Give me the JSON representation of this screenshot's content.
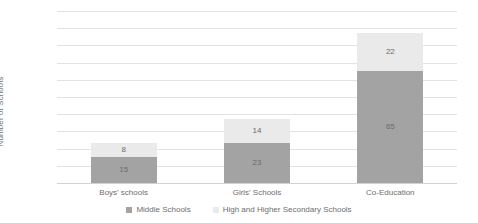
{
  "chart_data": {
    "type": "bar",
    "subtype": "stacked-bar",
    "title": "",
    "subtitle": "",
    "xlabel": "",
    "ylabel": "Number of Schools",
    "categories": [
      "Boys' schools",
      "Girls' Schools",
      "Co-Education"
    ],
    "series": [
      {
        "name": "Middle Schools",
        "color": "#a3a3a3",
        "values": [
          15,
          23,
          65
        ]
      },
      {
        "name": "High and Higher Secondary Schools",
        "color": "#eaeaea",
        "values": [
          8,
          14,
          22
        ]
      }
    ],
    "totals": [
      23,
      37,
      87
    ],
    "ylim": [
      0,
      100
    ],
    "ytick_step": 10,
    "yticks": [
      "100",
      "90",
      "80",
      "70",
      "60",
      "50",
      "40",
      "30",
      "20",
      "10",
      "0"
    ],
    "ytick_values": [
      100,
      90,
      80,
      70,
      60,
      50,
      40,
      30,
      20,
      10,
      0
    ],
    "data_labels": [
      {
        "category": "Boys' schools",
        "middle": "15",
        "high": "8"
      },
      {
        "category": "Girls' Schools",
        "middle": "23",
        "high": "14"
      },
      {
        "category": "Co-Education",
        "middle": "65",
        "high": "22"
      }
    ],
    "grid": {
      "horizontal": true,
      "vertical": false
    },
    "legend": {
      "position": "bottom",
      "entries": [
        {
          "label": "Middle Schools",
          "color": "#a3a3a3"
        },
        {
          "label": "High and Higher Secondary Schools",
          "color": "#eaeaea"
        }
      ]
    },
    "colors": {
      "middle_schools": "#a3a3a3",
      "high_and_higher_secondary_schools": "#eaeaea",
      "gridline": "#e2e2e2",
      "text": "#6e6e6e",
      "background": "#ffffff"
    }
  }
}
